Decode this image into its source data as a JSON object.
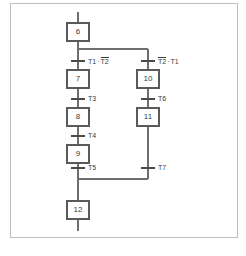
{
  "diagram": {
    "type": "sfc-grafcet",
    "frame_color": "#bfbfbf",
    "line_color": "#6e6e6e",
    "box_stroke": "#5a5a5a",
    "text_color": "#3a3a3a",
    "steps": [
      {
        "id": "step-6",
        "label": "6",
        "x": 78,
        "y": 32
      },
      {
        "id": "step-7",
        "label": "7",
        "x": 78,
        "y": 79
      },
      {
        "id": "step-8",
        "label": "8",
        "x": 78,
        "y": 117
      },
      {
        "id": "step-9",
        "label": "9",
        "x": 78,
        "y": 154
      },
      {
        "id": "step-10",
        "label": "10",
        "x": 148,
        "y": 79
      },
      {
        "id": "step-11",
        "label": "11",
        "x": 148,
        "y": 117
      },
      {
        "id": "step-12",
        "label": "12",
        "x": 78,
        "y": 210
      }
    ],
    "transitions": [
      {
        "id": "trans-t1t2",
        "label_plain": "T1 · T2",
        "left_term": "T1",
        "sep": "·",
        "right_term": "T2",
        "right_overline": true,
        "left_overline": false,
        "x": 78,
        "y": 61
      },
      {
        "id": "trans-t2t1",
        "label_plain": "T2 · T1",
        "left_term": "T2",
        "sep": "·",
        "right_term": "T1",
        "right_overline": false,
        "left_overline": true,
        "x": 148,
        "y": 61
      },
      {
        "id": "trans-t3",
        "label_plain": "T3",
        "left_term": "T3",
        "sep": "",
        "right_term": "",
        "right_overline": false,
        "left_overline": false,
        "x": 78,
        "y": 99
      },
      {
        "id": "trans-t4",
        "label_plain": "T4",
        "left_term": "T4",
        "sep": "",
        "right_term": "",
        "right_overline": false,
        "left_overline": false,
        "x": 78,
        "y": 136
      },
      {
        "id": "trans-t5",
        "label_plain": "T5",
        "left_term": "T5",
        "sep": "",
        "right_term": "",
        "right_overline": false,
        "left_overline": false,
        "x": 78,
        "y": 168
      },
      {
        "id": "trans-t6",
        "label_plain": "T6",
        "left_term": "T6",
        "sep": "",
        "right_term": "",
        "right_overline": false,
        "left_overline": false,
        "x": 148,
        "y": 99
      },
      {
        "id": "trans-t7",
        "label_plain": "T7",
        "left_term": "T7",
        "sep": "",
        "right_term": "",
        "right_overline": false,
        "left_overline": false,
        "x": 148,
        "y": 168
      }
    ],
    "labels": {
      "step_6": "6",
      "step_7": "7",
      "step_8": "8",
      "step_9": "9",
      "step_10": "10",
      "step_11": "11",
      "step_12": "12",
      "t1_t2": "T1 · T2",
      "t2_t1": "T2 · T1",
      "t3": "T3",
      "t4": "T4",
      "t5": "T5",
      "t6": "T6",
      "t7": "T7",
      "t1": "T1",
      "t2": "T2",
      "dot": "·"
    }
  }
}
